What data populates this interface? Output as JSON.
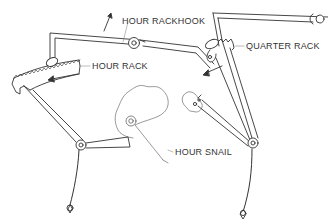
{
  "diagram": {
    "line_color": "#333333",
    "fill_color": "#ffffff",
    "labels": {
      "hour_rackhook": "HOUR RACKHOOK",
      "hour_rack": "HOUR RACK",
      "quarter_rack": "QUARTER RACK",
      "hour_snail": "HOUR SNAIL"
    },
    "components": [
      {
        "name": "hour-rackhook",
        "label": "HOUR RACKHOOK"
      },
      {
        "name": "hour-rack",
        "label": "HOUR RACK"
      },
      {
        "name": "quarter-rack",
        "label": "QUARTER RACK"
      },
      {
        "name": "hour-snail",
        "label": "HOUR SNAIL"
      },
      {
        "name": "quarter-snail",
        "label": ""
      },
      {
        "name": "left-rack-tail-pendulum",
        "label": ""
      },
      {
        "name": "right-rack-tail-pendulum",
        "label": ""
      }
    ],
    "arrows": [
      {
        "name": "rackhook-lift-arrow",
        "direction": "up"
      },
      {
        "name": "hour-rack-motion-arrow",
        "direction": "left"
      },
      {
        "name": "quarter-rack-motion-arrow",
        "direction": "down-left"
      }
    ]
  }
}
